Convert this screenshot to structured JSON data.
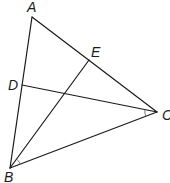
{
  "diagram": {
    "type": "triangle-with-cevians",
    "points": {
      "A": {
        "label": "A",
        "x": 32,
        "y": 17,
        "lx": 27,
        "ly": 12
      },
      "B": {
        "label": "B",
        "x": 10,
        "y": 168,
        "lx": 4,
        "ly": 182
      },
      "C": {
        "label": "C",
        "x": 157,
        "y": 112,
        "lx": 162,
        "ly": 120
      },
      "D": {
        "label": "D",
        "x": 22,
        "y": 85,
        "lx": 8,
        "ly": 90
      },
      "E": {
        "label": "E",
        "x": 89,
        "y": 60,
        "lx": 91,
        "ly": 57
      }
    },
    "segments": [
      {
        "from": "A",
        "to": "B"
      },
      {
        "from": "A",
        "to": "C"
      },
      {
        "from": "B",
        "to": "C"
      },
      {
        "from": "B",
        "to": "E"
      },
      {
        "from": "C",
        "to": "D"
      }
    ],
    "angle_marks": [
      {
        "vertex": "C",
        "between": [
          "D",
          "B"
        ]
      },
      {
        "vertex": "B",
        "between": [
          "E",
          "C"
        ]
      }
    ],
    "stroke_color": "#1a1a1a"
  }
}
